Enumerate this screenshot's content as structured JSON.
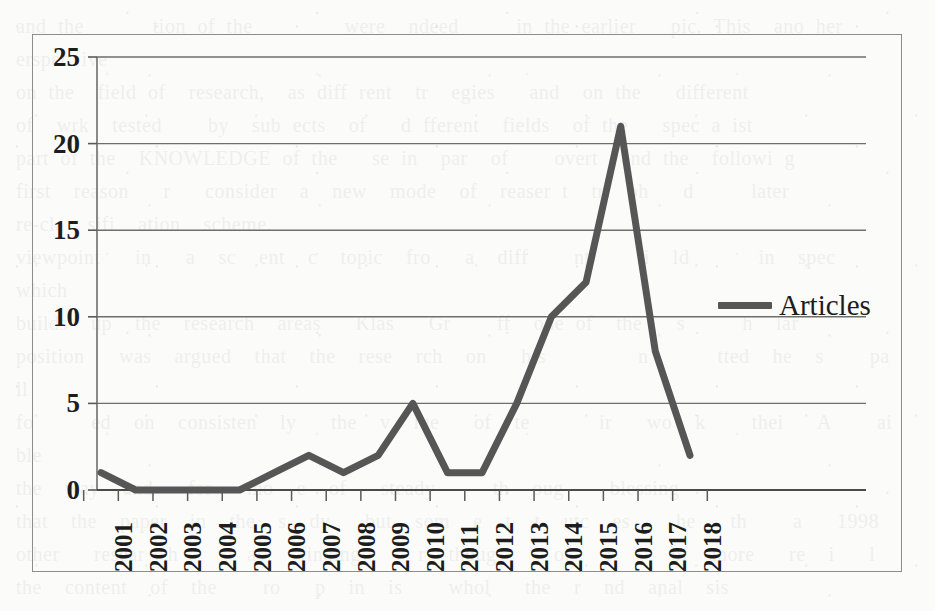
{
  "page": {
    "background_color": "#fbfbfa",
    "border_color": "#8d8d8d",
    "bleed_through_text": "and the      tion of the        were  ndeed     in the earlier   pic. This  ano her  erspec ive\non the  field of  research,  as diff rent  tr  egies   and  on the   different\nof  wrk  tested    by  sub ects  of   d fferent  fields  of the   spec a ist\npart of the  KNOWLEDGE of the   se in  par  of    overt  and the  followi g\nfirst  reason   r   consider  a  new  mode  of  reaser t  tr  ph   d     later\nre-cla  sifi  ation  scheme.\nviewpoint   in   a  sc  ent  c  topic  fro   a  diff    nt    fi  ld      in  spec      which\nbuilds  up  the  research  areas   Klas   Gr    ff  one of  the   s     h  lar\nposition   was  argued  that  the  rese  rch  on   his        n      tted  he  s    pa  ll\nfo     ed  on  consisten  ly   the  v  lue   of  te      ir   wo  k    thei   A    ai  ble\nthe  way  and   for   mo  e  of   steady     th  oug    blessing\nthat  the  paper  in  the  s  dy   but  som  e  t  t  utc  es    he   th    a   1998\nother   resear  h      as   finding     r  thoug     of   r     of  more   re  i   l\nthe  content  of  the    ro   p  in  is    whol   the  r  nd  anal  sis\nviewer  the  a    lic  tio  s  of  mul  iple     i  s   of    eac   the  resulting  perv  and  plan"
  },
  "chart_data": {
    "type": "line",
    "title": "",
    "xlabel": "",
    "ylabel": "",
    "categories": [
      "2001",
      "2002",
      "2003",
      "2004",
      "2005",
      "2006",
      "2007",
      "2008",
      "2009",
      "2010",
      "2011",
      "2012",
      "2013",
      "2014",
      "2015",
      "2016",
      "2017",
      "2018"
    ],
    "series": [
      {
        "name": "Articles",
        "color": "#565656",
        "values": [
          1,
          0,
          0,
          0,
          0,
          1,
          2,
          1,
          2,
          5,
          1,
          1,
          5,
          10,
          12,
          21,
          8,
          2
        ]
      }
    ],
    "ylim": [
      0,
      25
    ],
    "yticks": [
      0,
      5,
      10,
      15,
      20,
      25
    ],
    "ytick_labels": [
      "0",
      "5",
      "10",
      "15",
      "20",
      "25"
    ],
    "grid": "horizontal",
    "legend_position": "right",
    "legend_entries": [
      "Articles"
    ]
  }
}
